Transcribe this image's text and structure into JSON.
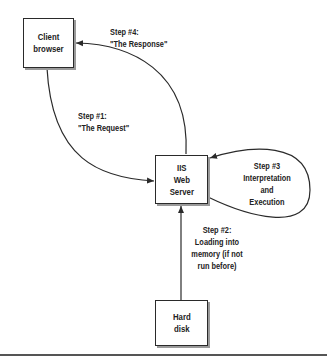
{
  "diagram": {
    "nodes": [
      {
        "id": "client",
        "label": "Client\nbrowser"
      },
      {
        "id": "iis",
        "label": "IIS\nWeb\nServer"
      },
      {
        "id": "disk",
        "label": "Hard\ndisk"
      }
    ],
    "edges": [
      {
        "id": "step1",
        "from": "client",
        "to": "iis",
        "label": "Step #1:\n\"The Request\""
      },
      {
        "id": "step2",
        "from": "disk",
        "to": "iis",
        "label": "Step #2:\nLoading into\nmemory (if not\nrun before)"
      },
      {
        "id": "step3",
        "from": "iis",
        "to": "iis",
        "label": "Step #3\nInterpretation\nand\nExecution"
      },
      {
        "id": "step4",
        "from": "iis",
        "to": "client",
        "label": "Step #4:\n\"The Response\""
      }
    ]
  },
  "colors": {
    "line": "#2a2a2a",
    "shadow": "#9a9a9a",
    "background": "#ffffff"
  }
}
